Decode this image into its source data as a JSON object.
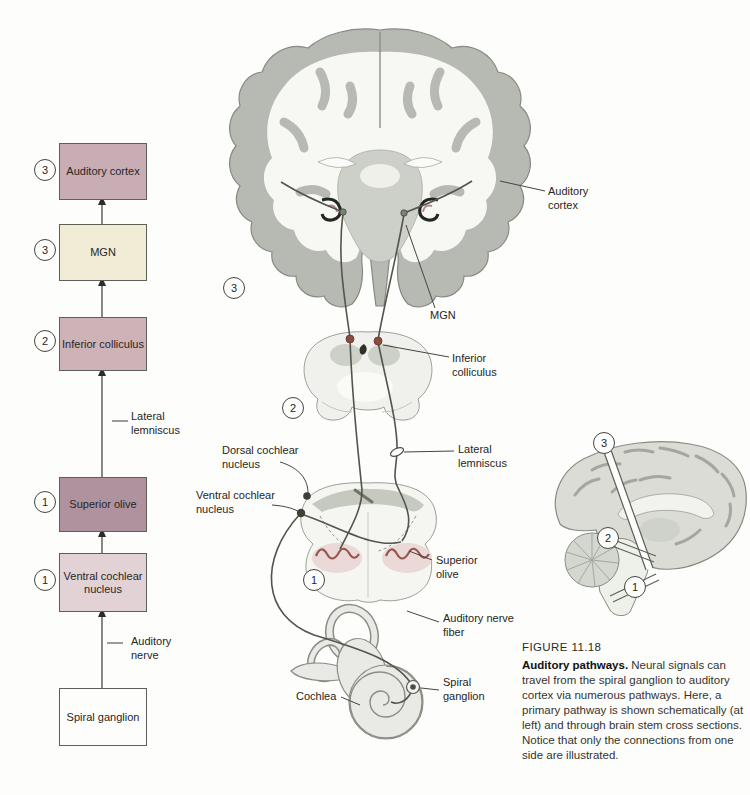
{
  "figure": {
    "label": "FIGURE 11.18",
    "caption_title": "Auditory pathways.",
    "caption_body": " Neural signals can travel from the spiral ganglion to auditory cortex via numerous pathways. Here, a primary pathway is shown schematically (at left) and through brain stem cross sections. Notice that only the connections from one side are illustrated."
  },
  "colors": {
    "auditory_cortex_box": "#c8adb4",
    "mgn_box": "#f1ecd6",
    "inferior_colliculus_box": "#cdb3b8",
    "superior_olive_box": "#b0929e",
    "ventral_cochlear_box": "#e2d2d6",
    "spiral_ganglion_box": "#fdfdfc"
  },
  "flowchart": {
    "nodes": [
      {
        "number": "3",
        "label": "Auditory cortex"
      },
      {
        "number": "3",
        "label": "MGN"
      },
      {
        "number": "2",
        "label": "Inferior colliculus"
      },
      {
        "number": "1",
        "label": "Superior olive"
      },
      {
        "number": "1",
        "label": "Ventral cochlear nucleus"
      },
      {
        "number": "",
        "label": "Spiral ganglion"
      }
    ],
    "edge_labels": [
      "Lateral lemniscus",
      "Auditory nerve"
    ]
  },
  "diagram": {
    "labels": {
      "auditory_cortex": "Auditory cortex",
      "mgn": "MGN",
      "inferior_colliculus": "Inferior colliculus",
      "lateral_lemniscus": "Lateral lemniscus",
      "dorsal_cochlear_nucleus": "Dorsal cochlear nucleus",
      "ventral_cochlear_nucleus": "Ventral cochlear nucleus",
      "superior_olive": "Superior olive",
      "auditory_nerve_fiber": "Auditory nerve fiber",
      "spiral_ganglion": "Spiral ganglion",
      "cochlea": "Cochlea"
    },
    "section_numbers": [
      "3",
      "2",
      "1"
    ],
    "sagittal_numbers": [
      "3",
      "2",
      "1"
    ]
  }
}
